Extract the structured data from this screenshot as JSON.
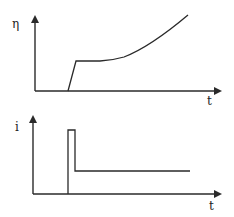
{
  "diagram": {
    "top_plot": {
      "y_label": "η",
      "x_label": "t",
      "curve_description": "zero until onset, sharp rise to plateau, then gradually increasing curve"
    },
    "bottom_plot": {
      "y_label": "i",
      "x_label": "t",
      "curve_description": "zero until onset, short high pulse, then constant lower level"
    },
    "colors": {
      "line": "#2a2a2a",
      "background": "#ffffff"
    }
  }
}
